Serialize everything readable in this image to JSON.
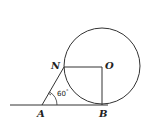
{
  "diagram": {
    "type": "geometry",
    "points": {
      "A": {
        "label": "A",
        "x": 42,
        "y": 105
      },
      "B": {
        "label": "B",
        "x": 103,
        "y": 105
      },
      "N": {
        "label": "N",
        "x": 63,
        "y": 67
      },
      "O": {
        "label": "O",
        "x": 102,
        "y": 66
      }
    },
    "circle": {
      "center": "O",
      "radius": 38
    },
    "angle": {
      "vertex": "A",
      "label": "60",
      "degree_symbol": "°"
    },
    "colors": {
      "stroke": "#333333",
      "background": "#ffffff"
    }
  }
}
